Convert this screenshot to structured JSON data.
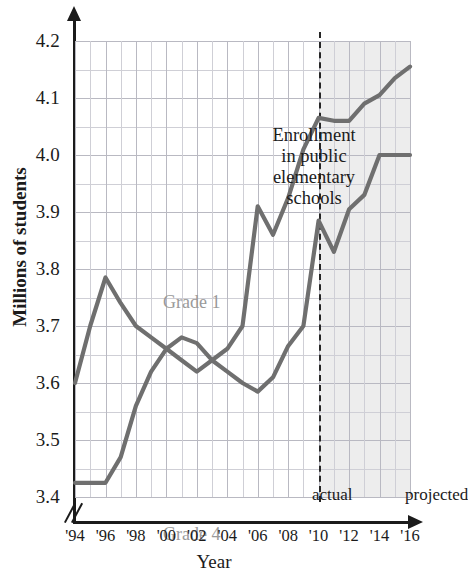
{
  "chart_data": {
    "type": "line",
    "title": "",
    "annotation": [
      "Enrollment",
      "in public",
      "elementary",
      "schools"
    ],
    "xlabel": "Year",
    "ylabel": "Millions of students",
    "x": [
      1994,
      1995,
      1996,
      1997,
      1998,
      1999,
      2000,
      2001,
      2002,
      2003,
      2004,
      2005,
      2006,
      2007,
      2008,
      2009,
      2010,
      2011,
      2012,
      2013,
      2014,
      2015,
      2016
    ],
    "xtick_labels": [
      "'94",
      "'96",
      "'98",
      "'00",
      "'02",
      "'04",
      "'06",
      "'08",
      "'10",
      "'12",
      "'14",
      "'16"
    ],
    "xtick_values": [
      1994,
      1996,
      1998,
      2000,
      2002,
      2004,
      2006,
      2008,
      2010,
      2012,
      2014,
      2016
    ],
    "ytick_labels": [
      "4.2",
      "4.1",
      "4.0",
      "3.9",
      "3.8",
      "3.7",
      "3.6",
      "3.5",
      "3.4"
    ],
    "ytick_values": [
      4.2,
      4.1,
      4.0,
      3.9,
      3.8,
      3.7,
      3.6,
      3.5,
      3.4
    ],
    "ylim": [
      3.4,
      4.2
    ],
    "xlim": [
      1994,
      2016
    ],
    "y_axis_break": true,
    "grid": true,
    "grid_step_y": 0.05,
    "grid_step_x": 1,
    "legend": "inline-labels",
    "divider_year": 2010,
    "region_labels": {
      "left": "actual",
      "right": "projected"
    },
    "series": [
      {
        "name": "Grade 1",
        "color": "#6f6f6f",
        "label_color": "#9a9a9a",
        "values": [
          3.6,
          3.7,
          3.785,
          3.74,
          3.7,
          3.68,
          3.66,
          3.64,
          3.62,
          3.64,
          3.66,
          3.7,
          3.91,
          3.86,
          3.925,
          4.01,
          4.065,
          4.06,
          4.06,
          4.09,
          4.105,
          4.135,
          4.155
        ]
      },
      {
        "name": "Grade 4",
        "color": "#6f6f6f",
        "label_color": "#9a9a9a",
        "values": [
          3.425,
          3.425,
          3.425,
          3.47,
          3.56,
          3.62,
          3.66,
          3.68,
          3.67,
          3.64,
          3.62,
          3.6,
          3.585,
          3.61,
          3.665,
          3.7,
          3.885,
          3.83,
          3.905,
          3.93,
          4.0,
          4.0,
          4.0
        ]
      }
    ]
  },
  "figure": {
    "background": "#ffffff",
    "grid_color": "#cfcfd6",
    "axis_color": "#1b1b1b",
    "projected_band_color": "#e6e6e6",
    "divider_style": "dashed"
  }
}
